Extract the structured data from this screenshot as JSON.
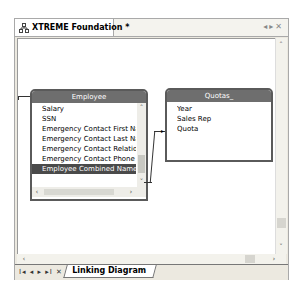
{
  "window": {
    "tab_title": "XTREME Foundation *",
    "tab_icon": "diagram-icon",
    "header_controls": [
      "prev-icon",
      "next-icon",
      "close-icon"
    ]
  },
  "diagram": {
    "tables": [
      {
        "name": "Employee",
        "fields": [
          "Salary",
          "SSN",
          "Emergency Contact First Nam",
          "Emergency Contact Last Nam",
          "Emergency Contact Relations",
          "Emergency Contact Phone",
          "Employee Combined Name"
        ],
        "selected_field": "Employee Combined Name"
      },
      {
        "name": "Quotas_",
        "fields": [
          "Year",
          "Sales Rep",
          "Quota"
        ]
      }
    ],
    "links": [
      {
        "from": "Employee.Employee Combined Name",
        "to": "Quotas_.Sales Rep"
      }
    ]
  },
  "bottom_bar": {
    "nav_buttons": [
      "first-icon",
      "prev-icon",
      "next-icon",
      "last-icon",
      "close-icon"
    ],
    "nav_glyphs": "I◂ ◂ ▸ ▸I ✕",
    "tab_label": "Linking Diagram"
  },
  "colors": {
    "table_header": "#6e6e6e",
    "selected_row": "#4a4a4a"
  }
}
